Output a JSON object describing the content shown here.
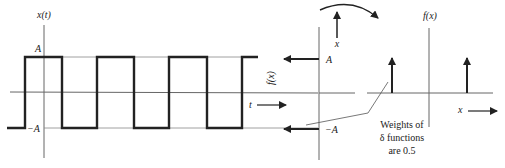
{
  "diagram": {
    "type": "signal-transform",
    "left_plot": {
      "y_axis_label": "x(t)",
      "level_high_label": "A",
      "level_low_label": "−A",
      "time_label": "t",
      "signal": "square wave alternating between A and −A"
    },
    "transfer": {
      "rotated_axis_label": "f(x)",
      "top_arrow_target_label": "A",
      "bottom_arrow_target_label": "−A",
      "rotation_axis_label": "x"
    },
    "right_plot": {
      "y_axis_label": "f(x)",
      "x_axis_label": "x",
      "impulses": [
        "−A",
        "A"
      ]
    },
    "annotation": {
      "line1": "Weights of",
      "line2": "δ functions",
      "line3": "are 0.5"
    },
    "colors": {
      "ink": "#222222",
      "grid": "#777777"
    }
  }
}
